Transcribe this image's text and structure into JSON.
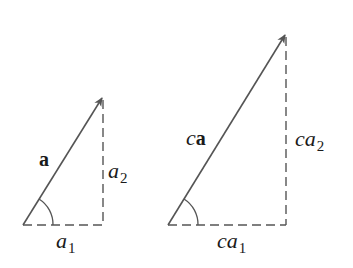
{
  "diagram": {
    "stroke_color": "#555555",
    "text_color": "#1a1a1a",
    "left_triangle": {
      "vector_label": "a",
      "vertical_label_base": "a",
      "vertical_label_sub": "2",
      "horizontal_label_base": "a",
      "horizontal_label_sub": "1"
    },
    "right_triangle": {
      "vector_label_scalar": "c",
      "vector_label": "a",
      "vertical_label_scalar": "c",
      "vertical_label_base": "a",
      "vertical_label_sub": "2",
      "horizontal_label_scalar": "c",
      "horizontal_label_base": "a",
      "horizontal_label_sub": "1"
    }
  }
}
